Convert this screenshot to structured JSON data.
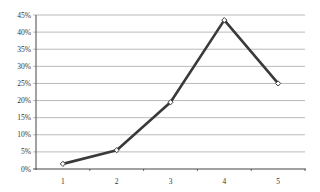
{
  "chart_data": {
    "type": "line",
    "title": "",
    "xlabel": "",
    "ylabel": "",
    "categories": [
      "1",
      "2",
      "3",
      "4",
      "5"
    ],
    "series": [
      {
        "name": "Series 1",
        "values": [
          1.5,
          5.5,
          19.5,
          43.5,
          25
        ]
      }
    ],
    "y_ticks": [
      "0%",
      "5%",
      "10%",
      "15%",
      "20%",
      "25%",
      "30%",
      "35%",
      "40%",
      "45%"
    ],
    "ylim": [
      0,
      45
    ],
    "grid": true,
    "legend": "none",
    "line_color": "#3a3a3a",
    "grid_color": "#a8a8a8",
    "marker": "hollow-diamond"
  }
}
